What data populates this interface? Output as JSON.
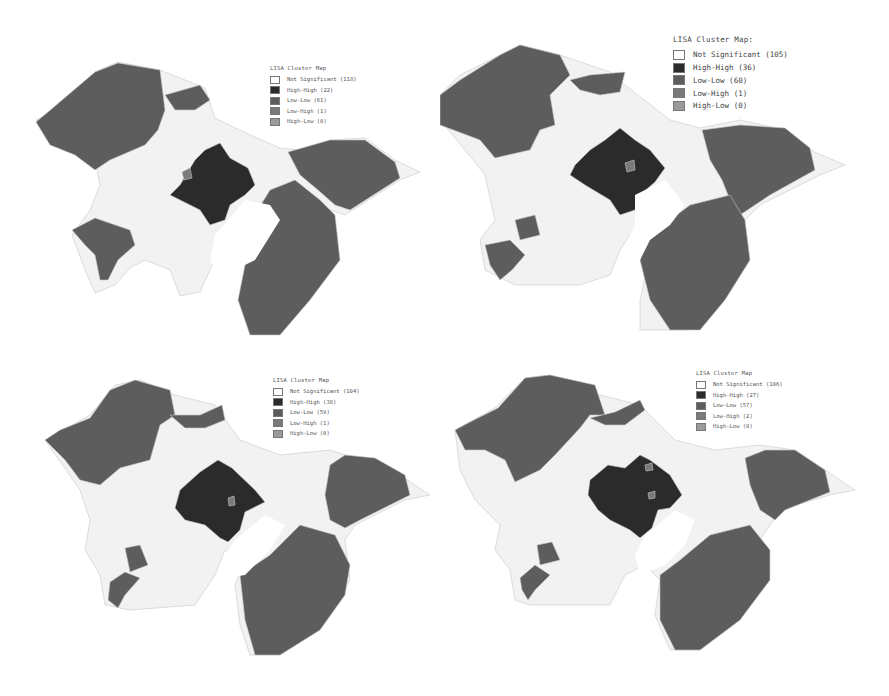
{
  "colors": {
    "not_significant": "#f2f2f2",
    "high_high": "#2b2b2b",
    "low_low": "#5d5d5d",
    "low_high": "#7a7a7a",
    "high_low": "#9a9a9a",
    "boundary": "#c8c8c8",
    "water": "#ffffff"
  },
  "maps": [
    {
      "legend": {
        "title": "LISA Cluster Map",
        "items": [
          {
            "label": "Not Significant (118)",
            "category": "not_significant",
            "count": 118
          },
          {
            "label": "High-High (22)",
            "category": "high_high",
            "count": 22
          },
          {
            "label": "Low-Low (61)",
            "category": "low_low",
            "count": 61
          },
          {
            "label": "Low-High (1)",
            "category": "low_high",
            "count": 1
          },
          {
            "label": "High-Low (0)",
            "category": "high_low",
            "count": 0
          }
        ]
      }
    },
    {
      "legend": {
        "title": "LISA Cluster Map:",
        "items": [
          {
            "label": "Not Significant (105)",
            "category": "not_significant",
            "count": 105
          },
          {
            "label": "High-High (36)",
            "category": "high_high",
            "count": 36
          },
          {
            "label": "Low-Low (60)",
            "category": "low_low",
            "count": 60
          },
          {
            "label": "Low-High (1)",
            "category": "low_high",
            "count": 1
          },
          {
            "label": "High-Low (0)",
            "category": "high_low",
            "count": 0
          }
        ]
      }
    },
    {
      "legend": {
        "title": "LISA Cluster Map",
        "items": [
          {
            "label": "Not Significant (104)",
            "category": "not_significant",
            "count": 104
          },
          {
            "label": "High-High (38)",
            "category": "high_high",
            "count": 38
          },
          {
            "label": "Low-Low (59)",
            "category": "low_low",
            "count": 59
          },
          {
            "label": "Low-High (1)",
            "category": "low_high",
            "count": 1
          },
          {
            "label": "High-Low (0)",
            "category": "high_low",
            "count": 0
          }
        ]
      }
    },
    {
      "legend": {
        "title": "LISA Cluster Map",
        "items": [
          {
            "label": "Not Significant (106)",
            "category": "not_significant",
            "count": 106
          },
          {
            "label": "High-High (27)",
            "category": "high_high",
            "count": 27
          },
          {
            "label": "Low-Low (57)",
            "category": "low_low",
            "count": 57
          },
          {
            "label": "Low-High (2)",
            "category": "low_high",
            "count": 2
          },
          {
            "label": "High-Low (0)",
            "category": "high_low",
            "count": 0
          }
        ]
      }
    }
  ]
}
